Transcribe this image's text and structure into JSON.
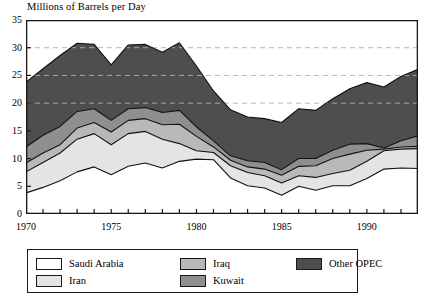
{
  "chart_data": {
    "type": "area",
    "stacked": true,
    "title": "Millions of Barrels per Day",
    "xlabel": "",
    "ylabel": "",
    "xlim": [
      1970,
      1993
    ],
    "ylim": [
      0,
      35
    ],
    "yticks": [
      0,
      5,
      10,
      15,
      20,
      25,
      30,
      35
    ],
    "xticks_labeled": [
      1970,
      1975,
      1980,
      1985,
      1990
    ],
    "xtick_interval": 1,
    "grid": "horizontal dashed at 20, 25, 30",
    "legend_position": "below-plot",
    "x": [
      1970,
      1971,
      1972,
      1973,
      1974,
      1975,
      1976,
      1977,
      1978,
      1979,
      1980,
      1981,
      1982,
      1983,
      1984,
      1985,
      1986,
      1987,
      1988,
      1989,
      1990,
      1991,
      1992,
      1993
    ],
    "series": [
      {
        "name": "Saudi Arabia",
        "color": "#ffffff",
        "values": [
          3.8,
          4.8,
          6.0,
          7.6,
          8.5,
          7.1,
          8.6,
          9.2,
          8.3,
          9.5,
          9.9,
          9.8,
          6.5,
          5.1,
          4.7,
          3.4,
          5.0,
          4.3,
          5.1,
          5.1,
          6.4,
          8.1,
          8.3,
          8.2
        ],
        "description": "bottom band, white fill"
      },
      {
        "name": "Iran",
        "color": "#e4e4e4",
        "values": [
          3.8,
          4.5,
          5.0,
          5.9,
          6.0,
          5.4,
          5.9,
          5.7,
          5.2,
          3.2,
          1.5,
          1.3,
          2.2,
          2.4,
          2.2,
          2.2,
          1.9,
          2.3,
          2.2,
          2.8,
          3.1,
          3.3,
          3.4,
          3.6
        ],
        "description": "second band, light gray"
      },
      {
        "name": "Iraq",
        "color": "#b9b9b9",
        "values": [
          1.6,
          1.7,
          1.5,
          2.0,
          2.0,
          2.3,
          2.4,
          2.3,
          2.6,
          3.5,
          2.6,
          1.0,
          1.0,
          1.0,
          1.2,
          1.4,
          1.7,
          2.1,
          2.7,
          2.9,
          2.0,
          0.3,
          0.4,
          0.4
        ],
        "description": "third band, medium-light gray"
      },
      {
        "name": "Kuwait",
        "color": "#8f8f8f",
        "values": [
          2.9,
          3.2,
          3.3,
          3.0,
          2.5,
          2.1,
          2.1,
          2.0,
          2.2,
          2.5,
          1.7,
          1.1,
          0.8,
          1.1,
          1.2,
          1.0,
          1.4,
          1.3,
          1.5,
          1.8,
          1.2,
          0.2,
          1.1,
          1.9
        ],
        "description": "fourth band, medium gray"
      },
      {
        "name": "Other OPEC",
        "color": "#4e4e4e",
        "values": [
          11.7,
          12.0,
          12.8,
          12.3,
          11.6,
          10.0,
          11.5,
          11.4,
          10.9,
          12.2,
          11.0,
          9.0,
          8.3,
          7.9,
          7.9,
          8.5,
          9.0,
          8.7,
          9.3,
          10.0,
          11.0,
          11.0,
          11.6,
          12.0
        ],
        "description": "top band, dark gray"
      }
    ],
    "cumulative_totals": [
      23.8,
      26.2,
      28.6,
      30.8,
      30.6,
      26.9,
      30.5,
      30.6,
      29.2,
      30.9,
      26.7,
      22.2,
      18.8,
      17.5,
      17.2,
      16.5,
      19.0,
      18.7,
      20.8,
      22.6,
      23.7,
      22.9,
      24.8,
      26.1
    ]
  },
  "legend": {
    "items": [
      {
        "label": "Saudi Arabia",
        "color": "#ffffff"
      },
      {
        "label": "Iran",
        "color": "#e4e4e4"
      },
      {
        "label": "Iraq",
        "color": "#b9b9b9"
      },
      {
        "label": "Kuwait",
        "color": "#8f8f8f"
      },
      {
        "label": "Other OPEC",
        "color": "#4e4e4e"
      }
    ]
  },
  "axes": {
    "y_labels": [
      "0",
      "5",
      "10",
      "15",
      "20",
      "25",
      "30",
      "35"
    ],
    "x_labels": [
      "1970",
      "1975",
      "1980",
      "1985",
      "1990"
    ]
  }
}
